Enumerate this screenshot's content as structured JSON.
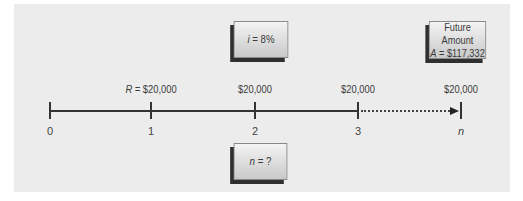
{
  "diagram": {
    "type": "cash-flow timeline (annuity, future amount)",
    "rate_box": {
      "var": "i",
      "eq": " = ",
      "value": "8%"
    },
    "future_box": {
      "title": "Future Amount",
      "var": "A",
      "eq": " = ",
      "value": "$117,332"
    },
    "n_box": {
      "var": "n",
      "eq": " = ",
      "value": "?"
    },
    "periods": [
      {
        "label": "0",
        "amount_prefix": "",
        "amount": ""
      },
      {
        "label": "1",
        "amount_prefix": "R = ",
        "amount": "$20,000"
      },
      {
        "label": "2",
        "amount_prefix": "",
        "amount": "$20,000"
      },
      {
        "label": "3",
        "amount_prefix": "",
        "amount": "$20,000"
      },
      {
        "label": "n",
        "amount_prefix": "",
        "amount": "$20,000"
      }
    ],
    "colors": {
      "panel": "#ececec",
      "line": "#333333",
      "box_shadow": "#2f2f2f"
    }
  }
}
